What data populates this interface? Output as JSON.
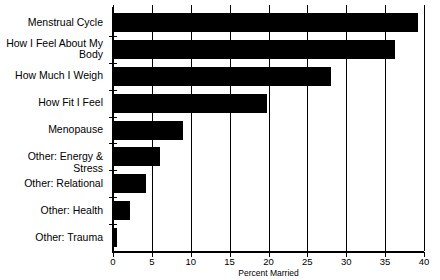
{
  "chart_data": {
    "type": "bar",
    "orientation": "horizontal",
    "title": "",
    "xlabel": "Percent Married",
    "ylabel": "",
    "xlim": [
      0,
      40
    ],
    "xticks": [
      0,
      5,
      10,
      15,
      20,
      25,
      30,
      35,
      40
    ],
    "xtick_labels": [
      "0",
      "5",
      "10",
      "15",
      "20",
      "25",
      "30",
      "35",
      "40"
    ],
    "grid": "vertical",
    "legend": "none",
    "bar_color": "#000000",
    "background_color": "#ffffff",
    "categories": [
      "Menstrual Cycle",
      "How I Feel About My\nBody",
      "How Much I Weigh",
      "How Fit I Feel",
      "Menopause",
      "Other: Energy & Stress",
      "Other: Relational",
      "Other: Health",
      "Other: Trauma"
    ],
    "values": [
      39.2,
      36.3,
      28.0,
      19.8,
      9.0,
      6.0,
      4.2,
      2.2,
      0.5
    ]
  }
}
